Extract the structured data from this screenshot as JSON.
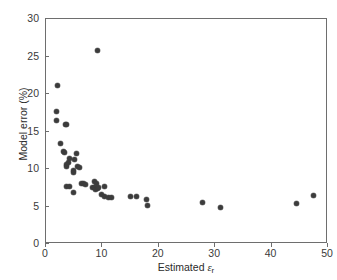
{
  "chart_data": {
    "type": "scatter",
    "title": "",
    "xlabel": "Estimated εr",
    "xlabel_prefix": "Estimated ",
    "xlabel_symbol": "ε",
    "xlabel_subscript": "r",
    "ylabel": "Model error (%)",
    "xlim": [
      0,
      50
    ],
    "ylim": [
      0,
      30
    ],
    "xticks": [
      0,
      10,
      20,
      30,
      40,
      50
    ],
    "yticks": [
      0,
      5,
      10,
      15,
      20,
      25,
      30
    ],
    "xtick_labels": [
      "0",
      "10",
      "20",
      "30",
      "40",
      "50"
    ],
    "ytick_labels": [
      "0",
      "5",
      "10",
      "15",
      "20",
      "25",
      "30"
    ],
    "grid": false,
    "legend": null,
    "marker": {
      "shape": "circle",
      "color": "#3c3c3c",
      "size_px": 5
    },
    "series": [
      {
        "name": "Model error vs estimated permittivity",
        "points": [
          [
            2.1,
            21.1
          ],
          [
            1.9,
            17.7
          ],
          [
            1.9,
            16.5
          ],
          [
            3.4,
            16.0
          ],
          [
            3.7,
            16.0
          ],
          [
            2.6,
            13.4
          ],
          [
            3.1,
            12.3
          ],
          [
            3.3,
            12.2
          ],
          [
            5.4,
            12.1
          ],
          [
            4.2,
            11.4
          ],
          [
            5.1,
            11.3
          ],
          [
            4.0,
            10.9
          ],
          [
            3.6,
            10.6
          ],
          [
            3.6,
            10.3
          ],
          [
            5.6,
            10.3
          ],
          [
            5.9,
            10.2
          ],
          [
            4.9,
            9.8
          ],
          [
            4.8,
            9.5
          ],
          [
            9.2,
            25.8
          ],
          [
            3.6,
            7.7
          ],
          [
            4.1,
            7.7
          ],
          [
            4.9,
            6.9
          ],
          [
            6.3,
            8.1
          ],
          [
            6.6,
            8.1
          ],
          [
            7.0,
            8.0
          ],
          [
            8.6,
            8.3
          ],
          [
            9.0,
            8.1
          ],
          [
            8.3,
            7.6
          ],
          [
            8.6,
            7.5
          ],
          [
            8.8,
            7.3
          ],
          [
            9.1,
            7.4
          ],
          [
            9.3,
            7.5
          ],
          [
            10.4,
            7.7
          ],
          [
            9.9,
            6.6
          ],
          [
            10.3,
            6.4
          ],
          [
            11.0,
            6.2
          ],
          [
            11.6,
            6.2
          ],
          [
            14.9,
            6.3
          ],
          [
            16.0,
            6.3
          ],
          [
            17.9,
            5.9
          ],
          [
            18.0,
            5.2
          ],
          [
            27.7,
            5.6
          ],
          [
            31.0,
            4.9
          ],
          [
            44.4,
            5.4
          ],
          [
            47.5,
            6.5
          ]
        ]
      }
    ]
  }
}
